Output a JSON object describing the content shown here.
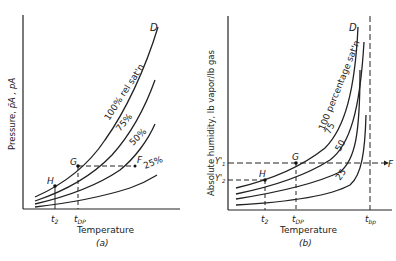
{
  "figure_a": {
    "ylabel": "Pressure, ",
    "ylabel_vars": "p̄A , pA",
    "xlabel": "Temperature",
    "caption": "(a)",
    "curve_labels": {
      "c100": "100% rel sat'n",
      "c75": "75%",
      "c50": "50%",
      "c25": "25%"
    },
    "points": {
      "D": "D",
      "G": "G",
      "F": "F",
      "H": "H"
    },
    "ticks": {
      "t2": "t",
      "t2_sub": "2",
      "tdp": "t",
      "tdp_sub": "DP"
    }
  },
  "figure_b": {
    "ylabel": "Absolute humidity, lb vapor/lb gas",
    "xlabel": "Temperature",
    "caption": "(b)",
    "curve_labels": {
      "c100": "100 percentage sat'n",
      "c75": "75",
      "c50": "50",
      "c25": "25"
    },
    "points": {
      "D": "D",
      "G": "G",
      "F": "F",
      "H": "H"
    },
    "yticks": {
      "y1": "Y'",
      "y1_sub": "1",
      "y2": "Y'",
      "y2_sub": "2"
    },
    "ticks": {
      "t2": "t",
      "t2_sub": "2",
      "tdp": "t",
      "tdp_sub": "DP",
      "tbp": "t",
      "tbp_sub": "bp"
    }
  }
}
